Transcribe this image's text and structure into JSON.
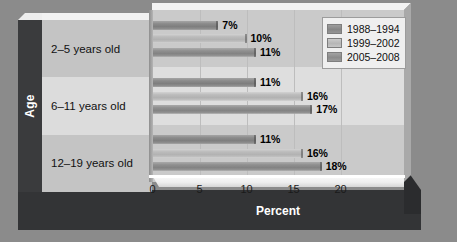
{
  "chart_data": {
    "type": "bar",
    "orientation": "horizontal",
    "title": "",
    "xlabel": "Percent",
    "ylabel": "Age",
    "categories": [
      "2–5 years old",
      "6–11 years old",
      "12–19 years old"
    ],
    "series": [
      {
        "name": "1988–1994",
        "values": [
          7,
          11,
          11
        ],
        "labels": [
          "7%",
          "11%",
          "11%"
        ],
        "color": "#8b8b8b"
      },
      {
        "name": "1999–2002",
        "values": [
          10,
          16,
          16
        ],
        "labels": [
          "10%",
          "16%",
          "16%"
        ],
        "color": "#bcbcbc"
      },
      {
        "name": "2005–2008",
        "values": [
          11,
          17,
          18
        ],
        "labels": [
          "11%",
          "17%",
          "18%"
        ],
        "color": "#909090"
      }
    ],
    "xlim": [
      0,
      23
    ],
    "xticks": [
      0,
      5,
      10,
      15,
      20
    ],
    "xtick_labels": [
      "0",
      "5",
      "10",
      "15",
      "20"
    ],
    "grid": true,
    "legend_position": "top-right",
    "value_labels_shown": true
  },
  "colors": {
    "figure_background": "#8b8b8b",
    "plot_background": "#cfcfcf",
    "base_slab": "#333436",
    "axis_panel": "#3a3b3d",
    "category_panel": "#c9c9c9",
    "legend_background": "#efefef",
    "label_text": "#000000",
    "axis_title_text": "#ffffff"
  }
}
